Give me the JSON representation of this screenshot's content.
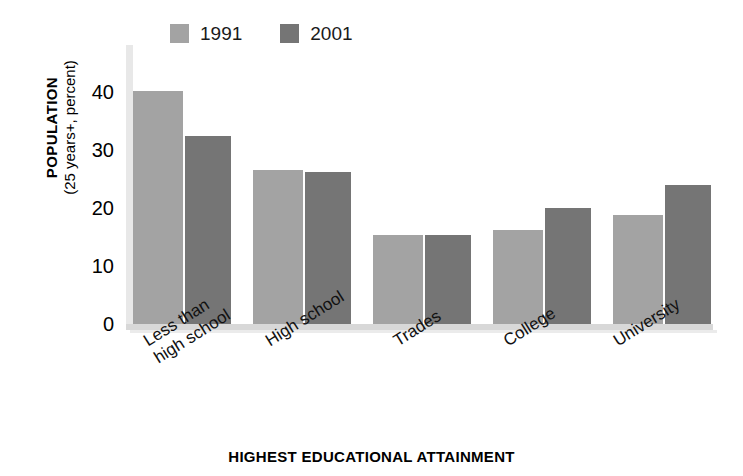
{
  "chart_data": {
    "type": "bar",
    "title": "",
    "subtitle": "",
    "categories": [
      "Less than\nhigh school",
      "High school",
      "Trades",
      "College",
      "University"
    ],
    "series": [
      {
        "name": "1991",
        "color": "#a3a3a3",
        "values": [
          40.6,
          26.8,
          15.5,
          16.3,
          19.0
        ]
      },
      {
        "name": "2001",
        "color": "#757575",
        "values": [
          32.7,
          26.4,
          15.5,
          20.1,
          24.2
        ]
      }
    ],
    "xlabel": "HIGHEST EDUCATIONAL ATTAINMENT",
    "ylabel_line1": "POPULATION",
    "ylabel_line2": "(25 years+, percent)",
    "yticks": [
      0,
      10,
      20,
      30,
      40
    ],
    "ylim": [
      0,
      44
    ],
    "grid": false,
    "legend_position": "top-left"
  },
  "legend": {
    "entries": [
      {
        "label": "1991",
        "color": "#a3a3a3"
      },
      {
        "label": "2001",
        "color": "#757575"
      }
    ]
  },
  "axis": {
    "y_title_line1": "POPULATION",
    "y_title_line2": "(25 years+, percent)",
    "x_title": "HIGHEST EDUCATIONAL ATTAINMENT",
    "ytick_labels": [
      "40",
      "30",
      "20",
      "10",
      "0"
    ]
  }
}
